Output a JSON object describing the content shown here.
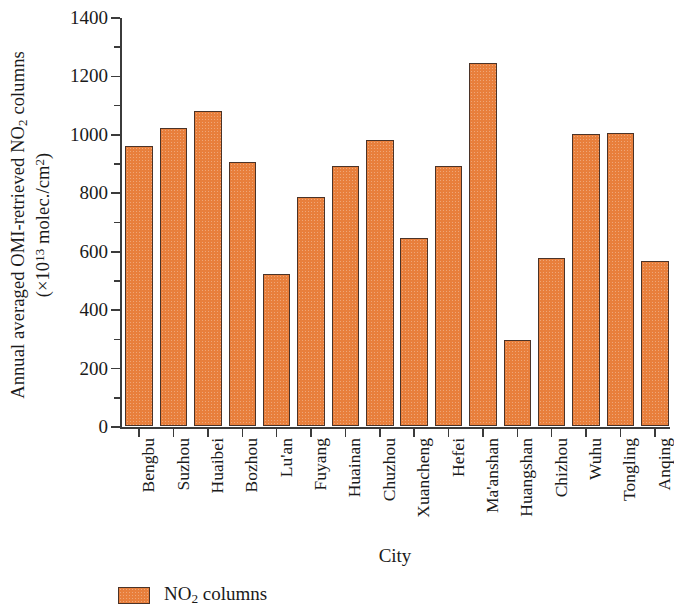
{
  "chart_data": {
    "type": "bar",
    "title": "",
    "categories": [
      "Bengbu",
      "Suzhou",
      "Huaibei",
      "Bozhou",
      "Lu'an",
      "Fuyang",
      "Huainan",
      "Chuzhou",
      "Xuancheng",
      "Hefei",
      "Ma'anshan",
      "Huangshan",
      "Chizhou",
      "Wuhu",
      "Tongling",
      "Anqing"
    ],
    "values": [
      960,
      1020,
      1078,
      905,
      520,
      783,
      890,
      978,
      645,
      890,
      1243,
      295,
      575,
      1000,
      1003,
      565
    ],
    "series": [
      {
        "name": "NO2 columns",
        "values": [
          960,
          1020,
          1078,
          905,
          520,
          783,
          890,
          978,
          645,
          890,
          1243,
          295,
          575,
          1000,
          1003,
          565
        ],
        "color": "#E87F3C"
      }
    ],
    "xlabel": "City",
    "ylabel_line1": "Annual averaged OMI-retrieved NO2 columns",
    "ylabel_line2": "(×10^13 molec./cm^2)",
    "ylim": [
      0,
      1400
    ],
    "ytick_values": [
      0,
      200,
      400,
      600,
      800,
      1000,
      1200,
      1400
    ],
    "ytick_labels": [
      "0",
      "200",
      "400",
      "600",
      "800",
      "1000",
      "1200",
      "1400"
    ],
    "yminor_values": [
      100,
      300,
      500,
      700,
      900,
      1100,
      1300
    ],
    "grid": false,
    "legend_position": "below-left",
    "legend_entries": [
      "NO2 columns"
    ],
    "bar_edge_color": "#4A3328",
    "axis_color": "#3B3B3B"
  },
  "axis": {
    "y_title_part1": "Annual averaged OMI-retrieved NO",
    "y_title_sub1": "2",
    "y_title_part2": " columns",
    "y_title_line2_a": "(×10",
    "y_title_line2_sup": "13",
    "y_title_line2_b": " molec./cm",
    "y_title_line2_sup2": "2",
    "y_title_line2_c": ")",
    "x_title": "City"
  },
  "legend": {
    "label_main": "NO",
    "label_sub": "2",
    "label_tail": " columns"
  }
}
